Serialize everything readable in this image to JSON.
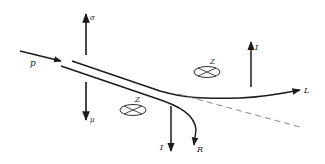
{
  "diagram": {
    "labels": {
      "incoming": "p",
      "up_left": "σ",
      "down_left": "μ",
      "z_left": "Z",
      "z_right": "Z",
      "up_right": "I",
      "down_right": "I",
      "branch_left": "L",
      "branch_right": "R"
    },
    "colors": {
      "stroke": "#1a1a1a",
      "dashed": "#888888"
    }
  }
}
